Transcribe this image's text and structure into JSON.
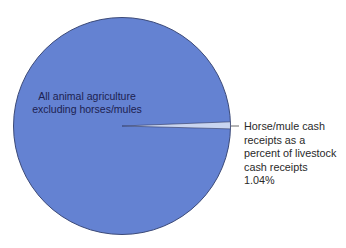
{
  "chart_data": {
    "type": "pie",
    "title": "",
    "slices": [
      {
        "label": "All animal agriculture excluding horses/mules",
        "value": 98.96,
        "color": "#6482d2"
      },
      {
        "label": "Horse/mule cash receipts as a percent of livestock cash receipts",
        "value": 1.04,
        "color": "#c9d5f0"
      }
    ],
    "annotations": [
      "1.04%"
    ],
    "legend": "none"
  },
  "labels": {
    "main_line1": "All animal agriculture",
    "main_line2": "excluding horses/mules",
    "slice_line1": "Horse/mule cash",
    "slice_line2": "receipts as a",
    "slice_line3": "percent of livestock",
    "slice_line4": "cash receipts",
    "slice_line5": "1.04%"
  }
}
